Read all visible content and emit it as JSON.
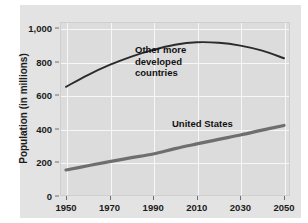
{
  "chart_data": {
    "type": "line",
    "title": "",
    "subtitle": "",
    "xlabel": "",
    "ylabel": "Population (in millions)",
    "xlim": [
      1950,
      2050
    ],
    "ylim": [
      0,
      1000
    ],
    "xticks": [
      "1950",
      "1970",
      "1990",
      "2010",
      "2030",
      "2050"
    ],
    "xtick_values": [
      1950,
      1970,
      1990,
      2010,
      2030,
      2050
    ],
    "yticks": [
      "0",
      "200",
      "400",
      "600",
      "800",
      "1,000"
    ],
    "ytick_values": [
      0,
      200,
      400,
      600,
      800,
      1000
    ],
    "grid": true,
    "legend": "inline-annotations",
    "series": [
      {
        "name": "Other more developed countries",
        "label_text": "Other more\ndeveloped\ncountries",
        "color": "#2b2b2b",
        "x": [
          1950,
          1960,
          1970,
          1980,
          1990,
          2000,
          2010,
          2020,
          2030,
          2040,
          2050
        ],
        "values": [
          650,
          720,
          780,
          830,
          870,
          900,
          915,
          912,
          895,
          865,
          820
        ]
      },
      {
        "name": "United States",
        "label_text": "United States",
        "color": "#6e6e6e",
        "x": [
          1950,
          1960,
          1970,
          1980,
          1990,
          2000,
          2010,
          2020,
          2030,
          2040,
          2050
        ],
        "values": [
          155,
          180,
          205,
          228,
          250,
          282,
          310,
          337,
          363,
          392,
          420
        ]
      }
    ]
  },
  "axis": {
    "y_title": "Population (in millions)",
    "y_tick_labels": [
      "1,000",
      "800",
      "600",
      "400",
      "200",
      "0"
    ],
    "x_tick_labels": [
      "1950",
      "1970",
      "1990",
      "2010",
      "2030",
      "2050"
    ]
  },
  "annotations": {
    "other_countries": "Other more\ndeveloped\ncountries",
    "united_states": "United States"
  },
  "colors": {
    "figure_background": "#ffffff",
    "panel_background": "#e3e3e3",
    "plot_background": "#dcdcdc",
    "gridline": "#f7f7f7",
    "series_other": "#2b2b2b",
    "series_us": "#6e6e6e",
    "text": "#1b1b1b"
  }
}
